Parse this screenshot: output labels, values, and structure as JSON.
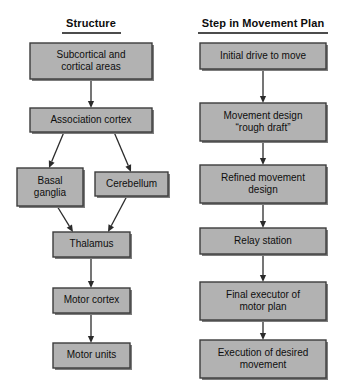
{
  "figure": {
    "background_color": "#ffffff",
    "box_fill_color": "#b2b2b2",
    "box_border_color": "#3c3c3c",
    "arrow_color": "#2b2b2b",
    "text_color": "#0e0e0e"
  },
  "columns": [
    {
      "id": "structure",
      "title": "Structure",
      "center_x": 91
    },
    {
      "id": "step",
      "title": "Step in Movement Plan",
      "center_x": 263
    }
  ],
  "chart_data": {
    "type": "diagram",
    "title": "",
    "nodes": [
      {
        "id": "subcortical",
        "column": "structure",
        "lines": [
          "Subcortical and",
          "cortical areas"
        ],
        "x": 30,
        "y": 43,
        "w": 122,
        "h": 36
      },
      {
        "id": "association",
        "column": "structure",
        "lines": [
          "Association cortex"
        ],
        "x": 30,
        "y": 108,
        "w": 122,
        "h": 24
      },
      {
        "id": "basal",
        "column": "structure",
        "lines": [
          "Basal",
          "ganglia"
        ],
        "x": 17,
        "y": 168,
        "w": 66,
        "h": 38
      },
      {
        "id": "cerebellum",
        "column": "structure",
        "lines": [
          "Cerebellum"
        ],
        "x": 95,
        "y": 172,
        "w": 73,
        "h": 24
      },
      {
        "id": "thalamus",
        "column": "structure",
        "lines": [
          "Thalamus"
        ],
        "x": 53,
        "y": 232,
        "w": 77,
        "h": 25
      },
      {
        "id": "motorcortex",
        "column": "structure",
        "lines": [
          "Motor cortex"
        ],
        "x": 53,
        "y": 288,
        "w": 77,
        "h": 25
      },
      {
        "id": "motorunits",
        "column": "structure",
        "lines": [
          "Motor units"
        ],
        "x": 53,
        "y": 343,
        "w": 77,
        "h": 25
      },
      {
        "id": "initialdrive",
        "column": "step",
        "lines": [
          "Initial drive to move"
        ],
        "x": 200,
        "y": 43,
        "w": 126,
        "h": 26
      },
      {
        "id": "roughdraft",
        "column": "step",
        "lines": [
          "Movement design",
          "“rough draft”"
        ],
        "x": 200,
        "y": 103,
        "w": 126,
        "h": 38
      },
      {
        "id": "refined",
        "column": "step",
        "lines": [
          "Refined movement",
          "design"
        ],
        "x": 200,
        "y": 165,
        "w": 126,
        "h": 38
      },
      {
        "id": "relay",
        "column": "step",
        "lines": [
          "Relay station"
        ],
        "x": 200,
        "y": 228,
        "w": 126,
        "h": 26
      },
      {
        "id": "finalexec",
        "column": "step",
        "lines": [
          "Final executor of",
          "motor plan"
        ],
        "x": 200,
        "y": 282,
        "w": 126,
        "h": 38
      },
      {
        "id": "execution",
        "column": "step",
        "lines": [
          "Execution of desired",
          "movement"
        ],
        "x": 200,
        "y": 340,
        "w": 126,
        "h": 38
      }
    ],
    "edges": [
      {
        "from": "subcortical",
        "to": "association",
        "kind": "vertical",
        "x1": 91,
        "y1": 79,
        "x2": 91,
        "y2": 108
      },
      {
        "from": "association",
        "to": "basal",
        "kind": "diagonal",
        "x1": 64,
        "y1": 132,
        "x2": 49,
        "y2": 168
      },
      {
        "from": "association",
        "to": "cerebellum",
        "kind": "diagonal",
        "x1": 114,
        "y1": 132,
        "x2": 131,
        "y2": 172
      },
      {
        "from": "basal",
        "to": "thalamus",
        "kind": "diagonal",
        "x1": 57,
        "y1": 206,
        "x2": 73,
        "y2": 232
      },
      {
        "from": "cerebellum",
        "to": "thalamus",
        "kind": "diagonal",
        "x1": 127,
        "y1": 196,
        "x2": 108,
        "y2": 232
      },
      {
        "from": "thalamus",
        "to": "motorcortex",
        "kind": "vertical",
        "x1": 91,
        "y1": 257,
        "x2": 91,
        "y2": 288
      },
      {
        "from": "motorcortex",
        "to": "motorunits",
        "kind": "vertical",
        "x1": 91,
        "y1": 313,
        "x2": 91,
        "y2": 343
      },
      {
        "from": "initialdrive",
        "to": "roughdraft",
        "kind": "vertical",
        "x1": 263,
        "y1": 69,
        "x2": 263,
        "y2": 103
      },
      {
        "from": "roughdraft",
        "to": "refined",
        "kind": "vertical",
        "x1": 263,
        "y1": 141,
        "x2": 263,
        "y2": 165
      },
      {
        "from": "refined",
        "to": "relay",
        "kind": "vertical",
        "x1": 263,
        "y1": 203,
        "x2": 263,
        "y2": 228
      },
      {
        "from": "relay",
        "to": "finalexec",
        "kind": "vertical",
        "x1": 263,
        "y1": 254,
        "x2": 263,
        "y2": 282
      },
      {
        "from": "finalexec",
        "to": "execution",
        "kind": "vertical",
        "x1": 263,
        "y1": 320,
        "x2": 263,
        "y2": 340
      }
    ]
  },
  "headers": {
    "rule_y": 33,
    "text_y": 27,
    "structure_rule": {
      "x1": 62,
      "x2": 121
    },
    "step_rule": {
      "x1": 198,
      "x2": 328
    }
  }
}
